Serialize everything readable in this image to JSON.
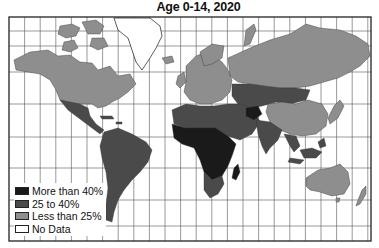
{
  "title": "Age 0-14, 2020",
  "colors": {
    "more_than_40": "#1a1a1a",
    "25_to_40": "#4a4a4a",
    "less_than_25": "#8e8e8e",
    "no_data": "#ffffff",
    "grid": "#555555",
    "frame": "#222222"
  },
  "legend": {
    "items": [
      {
        "label": "More than 40%",
        "category": "more_than_40"
      },
      {
        "label": "25 to 40%",
        "category": "25_to_40"
      },
      {
        "label": "Less than 25%",
        "category": "less_than_25"
      },
      {
        "label": "No Data",
        "category": "no_data"
      }
    ]
  },
  "regions": [
    {
      "name": "North America (USA & Canada)",
      "category": "less_than_25"
    },
    {
      "name": "Greenland",
      "category": "no_data"
    },
    {
      "name": "Mexico & Central America",
      "category": "25_to_40"
    },
    {
      "name": "South America",
      "category": "25_to_40"
    },
    {
      "name": "Europe",
      "category": "less_than_25"
    },
    {
      "name": "Russia",
      "category": "less_than_25"
    },
    {
      "name": "China",
      "category": "less_than_25"
    },
    {
      "name": "Japan",
      "category": "less_than_25"
    },
    {
      "name": "Mongolia & Central Asia",
      "category": "25_to_40"
    },
    {
      "name": "Middle East & North Africa",
      "category": "25_to_40"
    },
    {
      "name": "Sub-Saharan Africa",
      "category": "more_than_40"
    },
    {
      "name": "Southern Africa",
      "category": "25_to_40"
    },
    {
      "name": "Afghanistan",
      "category": "more_than_40"
    },
    {
      "name": "India & South Asia",
      "category": "25_to_40"
    },
    {
      "name": "Southeast Asia",
      "category": "25_to_40"
    },
    {
      "name": "Australia",
      "category": "less_than_25"
    },
    {
      "name": "New Zealand",
      "category": "less_than_25"
    },
    {
      "name": "Madagascar",
      "category": "more_than_40"
    }
  ]
}
